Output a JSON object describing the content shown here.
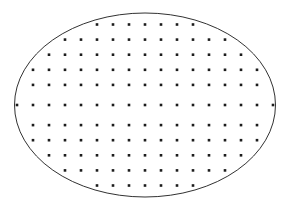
{
  "figure": {
    "type": "point-lattice-in-ellipse",
    "canvas": {
      "width": 289,
      "height": 209,
      "background": "#ffffff"
    },
    "boundary": {
      "shape": "ellipse",
      "center_x": 145,
      "center_y": 105,
      "radius_x": 130.5,
      "radius_y": 92,
      "stroke_color": "#1a1a1a",
      "stroke_width": 0.9,
      "fill": "none"
    },
    "lattice": {
      "origin_x": 145,
      "origin_y": 105,
      "spacing_x": 16,
      "spacing_y": 15.1,
      "dot_color": "#1c1c1c",
      "dot_size": 2.6,
      "dot_shape": "square",
      "total_points": 139,
      "row_count": 11,
      "rows": [
        {
          "y": 24.5,
          "count": 7,
          "xs": [
            97,
            113,
            129,
            145,
            161,
            177,
            193
          ]
        },
        {
          "y": 39.6,
          "count": 11,
          "xs": [
            65,
            81,
            97,
            113,
            129,
            145,
            161,
            177,
            193,
            209,
            225
          ]
        },
        {
          "y": 54.7,
          "count": 13,
          "xs": [
            49,
            65,
            81,
            97,
            113,
            129,
            145,
            161,
            177,
            193,
            209,
            225,
            241
          ]
        },
        {
          "y": 69.8,
          "count": 15,
          "xs": [
            33,
            49,
            65,
            81,
            97,
            113,
            129,
            145,
            161,
            177,
            193,
            209,
            225,
            241,
            257
          ]
        },
        {
          "y": 84.9,
          "count": 15,
          "xs": [
            33,
            49,
            65,
            81,
            97,
            113,
            129,
            145,
            161,
            177,
            193,
            209,
            225,
            241,
            257
          ]
        },
        {
          "y": 105,
          "count": 17,
          "xs": [
            17,
            33,
            49,
            65,
            81,
            97,
            113,
            129,
            145,
            161,
            177,
            193,
            209,
            225,
            241,
            257,
            273
          ]
        },
        {
          "y": 125.1,
          "count": 15,
          "xs": [
            33,
            49,
            65,
            81,
            97,
            113,
            129,
            145,
            161,
            177,
            193,
            209,
            225,
            241,
            257
          ]
        },
        {
          "y": 140.2,
          "count": 15,
          "xs": [
            33,
            49,
            65,
            81,
            97,
            113,
            129,
            145,
            161,
            177,
            193,
            209,
            225,
            241,
            257
          ]
        },
        {
          "y": 155.3,
          "count": 13,
          "xs": [
            49,
            65,
            81,
            97,
            113,
            129,
            145,
            161,
            177,
            193,
            209,
            225,
            241
          ]
        },
        {
          "y": 170.4,
          "count": 11,
          "xs": [
            65,
            81,
            97,
            113,
            129,
            145,
            161,
            177,
            193,
            209,
            225
          ]
        },
        {
          "y": 185.5,
          "count": 7,
          "xs": [
            97,
            113,
            129,
            145,
            161,
            177,
            193
          ]
        }
      ]
    }
  }
}
